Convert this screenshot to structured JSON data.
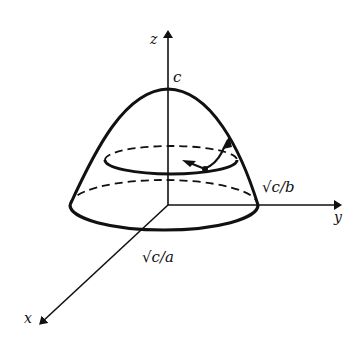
{
  "diagram": {
    "type": "3d-surface-sketch",
    "labels": {
      "z_axis": "z",
      "y_axis": "y",
      "x_axis": "x",
      "apex": "c",
      "y_intercept": "√c/b",
      "x_intercept": "√c/a"
    },
    "colors": {
      "stroke": "#111111",
      "background": "#ffffff"
    }
  }
}
